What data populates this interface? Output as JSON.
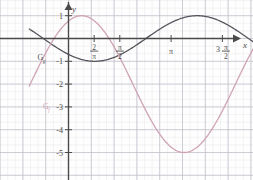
{
  "figure": {
    "type": "function-graph",
    "background": "#fefefe",
    "grid": {
      "minor_color": "#e8e6ea",
      "major_color": "#bfbcc6",
      "minor_step_px": 7.6,
      "major_step_px": 22.8,
      "visible": true
    },
    "axis_color": "#4a4a4a",
    "axis_x_label": "x",
    "axis_y_label": "y"
  },
  "axes": {
    "x_ticks": [
      {
        "label_num": "2",
        "label_den": "π",
        "kind": "fraction",
        "x_units": 0.7854
      },
      {
        "label_num": "π",
        "label_den": "2",
        "kind": "fraction",
        "x_units": 1.5708
      },
      {
        "label": "π",
        "kind": "plain",
        "x_units": 3.1416
      },
      {
        "label_pre": "3",
        "label_num": "π",
        "label_den": "2",
        "kind": "coef-fraction",
        "x_units": 4.7124
      },
      {
        "label": "2π",
        "kind": "plain",
        "x_units": 6.2832
      }
    ],
    "y_ticks": [
      {
        "label": "1",
        "value": 1
      },
      {
        "label": "-1",
        "value": -1
      },
      {
        "label": "-2",
        "value": -2
      },
      {
        "label": "-3",
        "value": -3
      },
      {
        "label": "-4",
        "value": -4
      },
      {
        "label": "-5",
        "value": -5
      }
    ],
    "x_range_units": [
      -1.2,
      7.6
    ],
    "y_range_units": [
      -5.9,
      1.6
    ]
  },
  "curves": [
    {
      "name": "G_g",
      "label_main": "G",
      "label_sub": "g",
      "color": "#56545c",
      "width": 1.3,
      "label_x_units": -0.95,
      "label_y_units": -0.95,
      "description": "cosine-like wave, amplitude 1, period 2π, minimum -1 near x=0.8 and x=4.6, maximum 1 near x=2.5 and x=6.9"
    },
    {
      "name": "G_f",
      "label_main": "G",
      "label_sub": "f",
      "color": "#cfa3b4",
      "width": 1.3,
      "label_x_units": -0.78,
      "label_y_units": -3.1,
      "description": "wave with amplitude 3 about y=-2, period 2π, maximum 1 near x=0.4 and x=6.7, minimum -5 near x=3.5"
    }
  ],
  "chart_data": {
    "type": "line",
    "title": "",
    "xlabel": "x",
    "ylabel": "y",
    "xlim": [
      -1.2,
      7.6
    ],
    "ylim": [
      -5.9,
      1.6
    ],
    "grid": true,
    "legend": "inline-curve-labels",
    "xtick_labels": [
      "2/π",
      "π/2",
      "π",
      "3π/2",
      "2π"
    ],
    "xtick_values": [
      0.7854,
      1.5708,
      3.1416,
      4.7124,
      6.2832
    ],
    "ytick_labels": [
      "1",
      "-1",
      "-2",
      "-3",
      "-4",
      "-5"
    ],
    "ytick_values": [
      1,
      -1,
      -2,
      -3,
      -4,
      -5
    ],
    "series": [
      {
        "name": "G_g",
        "color": "#56545c",
        "formula": "y = -cos(x - 0.8)",
        "points_x": [
          -1.2,
          -0.9,
          -0.6,
          -0.3,
          0.0,
          0.3,
          0.6,
          0.8,
          1.1,
          1.4,
          1.7,
          2.0,
          2.3,
          2.6,
          2.9,
          3.2,
          3.5,
          3.8,
          4.1,
          4.4,
          4.7,
          5.0,
          5.3,
          5.6,
          5.9,
          6.2,
          6.5,
          6.8,
          7.1,
          7.4,
          7.6
        ],
        "points_y": [
          -0.54,
          -0.25,
          0.07,
          0.36,
          0.7,
          0.87,
          0.98,
          1.0,
          0.96,
          0.83,
          0.6,
          0.31,
          -0.01,
          -0.33,
          -0.62,
          -0.84,
          -0.97,
          -1.0,
          -0.93,
          -0.76,
          -0.52,
          -0.23,
          0.09,
          0.4,
          0.67,
          0.88,
          0.99,
          1.0,
          0.91,
          0.74,
          0.58
        ]
      },
      {
        "name": "G_f",
        "color": "#cfa3b4",
        "formula": "y = -2 + 3*cos(x - 0.4)",
        "points_x": [
          -1.2,
          -0.9,
          -0.6,
          -0.3,
          0.0,
          0.3,
          0.6,
          0.9,
          1.2,
          1.5,
          1.8,
          2.1,
          2.4,
          2.7,
          3.0,
          3.3,
          3.5,
          3.8,
          4.1,
          4.4,
          4.7,
          5.0,
          5.3,
          5.6,
          5.9,
          6.2,
          6.5,
          6.8,
          7.1,
          7.4,
          7.6
        ],
        "points_y": [
          -5.0,
          -4.72,
          -4.2,
          -3.5,
          -2.0,
          -0.84,
          0.97,
          1.0,
          0.66,
          0.0,
          -0.9,
          -1.9,
          -2.9,
          -3.7,
          -4.4,
          -4.9,
          -5.0,
          -4.9,
          -4.5,
          -3.9,
          -3.0,
          -2.0,
          -0.95,
          0.0,
          0.7,
          1.0,
          0.95,
          0.6,
          -0.1,
          -1.1,
          -1.9
        ]
      }
    ]
  }
}
